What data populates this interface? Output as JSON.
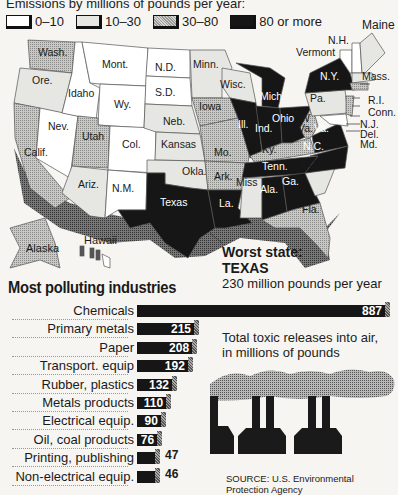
{
  "map": {
    "subtitle": "Emissions by millions of pounds per year:",
    "legend": [
      {
        "label": "0–10",
        "color": "#ffffff"
      },
      {
        "label": "10–30",
        "color": "#e6e6e3"
      },
      {
        "label": "30–80",
        "color": "#b4b4b1"
      },
      {
        "label": "80 or more",
        "color": "#161616"
      }
    ],
    "states": [
      {
        "name": "Wash.",
        "category": "30–80"
      },
      {
        "name": "Ore.",
        "category": "10–30"
      },
      {
        "name": "Calif.",
        "category": "30–80"
      },
      {
        "name": "Idaho",
        "category": "0–10"
      },
      {
        "name": "Nev.",
        "category": "0–10"
      },
      {
        "name": "Mont.",
        "category": "0–10"
      },
      {
        "name": "Wy.",
        "category": "0–10"
      },
      {
        "name": "Utah",
        "category": "30–80"
      },
      {
        "name": "Col.",
        "category": "0–10"
      },
      {
        "name": "Ariz.",
        "category": "10–30"
      },
      {
        "name": "N.M.",
        "category": "0–10"
      },
      {
        "name": "N.D.",
        "category": "0–10"
      },
      {
        "name": "S.D.",
        "category": "0–10"
      },
      {
        "name": "Neb.",
        "category": "10–30"
      },
      {
        "name": "Kansas",
        "category": "10–30"
      },
      {
        "name": "Okla.",
        "category": "10–30"
      },
      {
        "name": "Texas",
        "category": "80 or more"
      },
      {
        "name": "Minn.",
        "category": "10–30"
      },
      {
        "name": "Iowa",
        "category": "30–80"
      },
      {
        "name": "Mo.",
        "category": "30–80"
      },
      {
        "name": "Ark.",
        "category": "30–80"
      },
      {
        "name": "La.",
        "category": "80 or more"
      },
      {
        "name": "Wisc.",
        "category": "10–30"
      },
      {
        "name": "Ill.",
        "category": "80 or more"
      },
      {
        "name": "Miss",
        "category": "10–30"
      },
      {
        "name": "Mich.",
        "category": "80 or more"
      },
      {
        "name": "Ind.",
        "category": "80 or more"
      },
      {
        "name": "Ohio",
        "category": "80 or more"
      },
      {
        "name": "Ky.",
        "category": "30–80"
      },
      {
        "name": "Tenn.",
        "category": "80 or more"
      },
      {
        "name": "Ala.",
        "category": "80 or more"
      },
      {
        "name": "Ga.",
        "category": "80 or more"
      },
      {
        "name": "Fla.",
        "category": "30–80"
      },
      {
        "name": "S.C.",
        "category": "10–30"
      },
      {
        "name": "N.C.",
        "category": "80 or more"
      },
      {
        "name": "Va.",
        "category": "80 or more"
      },
      {
        "name": "W Va.",
        "category": "30–80"
      },
      {
        "name": "Pa.",
        "category": "10–30"
      },
      {
        "name": "N.Y.",
        "category": "80 or more"
      },
      {
        "name": "Vermont",
        "category": "0–10"
      },
      {
        "name": "N.H.",
        "category": "0–10"
      },
      {
        "name": "Maine",
        "category": "10–30"
      },
      {
        "name": "Mass.",
        "category": "10–30"
      },
      {
        "name": "R.I.",
        "category": "0–10"
      },
      {
        "name": "Conn.",
        "category": "10–30"
      },
      {
        "name": "N.J.",
        "category": "30–80"
      },
      {
        "name": "Del.",
        "category": "0–10"
      },
      {
        "name": "Md.",
        "category": "30–80"
      },
      {
        "name": "Alaska",
        "category": "10–30"
      },
      {
        "name": "Hawaii",
        "category": "0–10"
      }
    ],
    "labels": {
      "wash": "Wash.",
      "ore": "Ore.",
      "calif": "Calif.",
      "idaho": "Idaho",
      "nev": "Nev.",
      "mont": "Mont.",
      "wy": "Wy.",
      "utah": "Utah",
      "col": "Col.",
      "ariz": "Ariz.",
      "nm": "N.M.",
      "nd": "N.D.",
      "sd": "S.D.",
      "neb": "Neb.",
      "kansas": "Kansas",
      "okla": "Okla.",
      "texas": "Texas",
      "minn": "Minn.",
      "iowa": "Iowa",
      "mo": "Mo.",
      "ark": "Ark.",
      "la": "La.",
      "wisc": "Wisc.",
      "ill": "Ill.",
      "miss": "Miss",
      "mich": "Mich.",
      "ind": "Ind.",
      "ohio": "Ohio",
      "ky": "Ky.",
      "tenn": "Tenn.",
      "ala": "Ala.",
      "ga": "Ga.",
      "fla": "Fla.",
      "sc": "S.C.",
      "nc": "N.C.",
      "va": "Va.",
      "wva1": "W",
      "wva2": "Va.",
      "pa": "Pa.",
      "ny": "N.Y.",
      "vermont": "Vermont",
      "nh": "N.H.",
      "maine": "Maine",
      "mass": "Mass.",
      "ri": "R.I.",
      "conn": "Conn.",
      "nj": "N.J.",
      "del": "Del.",
      "md": "Md.",
      "alaska": "Alaska",
      "hawaii": "Hawaii"
    },
    "worst": {
      "heading": "Worst state:",
      "state": "TEXAS",
      "detail": "230 million pounds per year"
    }
  },
  "industries": {
    "title": "Most polluting industries",
    "note": "Total toxic releases into air, in millions of pounds",
    "note_line1": "Total toxic releases into air,",
    "note_line2": "in millions of pounds",
    "source": "SOURCE: U.S. Environmental Protection Agency"
  },
  "chart_data": {
    "type": "bar",
    "orientation": "horizontal",
    "title": "Most polluting industries",
    "subtitle": "Total toxic releases into air, in millions of pounds",
    "categories": [
      "Chemicals",
      "Primary metals",
      "Paper",
      "Transport. equip",
      "Rubber, plastics",
      "Metals products",
      "Electrical equip.",
      "Oil, coal products",
      "Printing, publishing",
      "Non-electrical equip."
    ],
    "values": [
      887,
      215,
      208,
      192,
      132,
      110,
      90,
      76,
      47,
      46
    ],
    "xlabel": "",
    "ylabel": "",
    "source": "SOURCE: U.S. Environmental Protection Agency"
  }
}
